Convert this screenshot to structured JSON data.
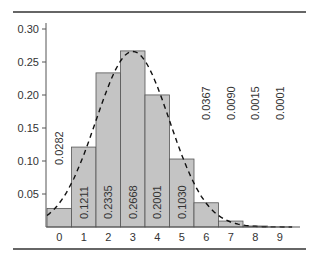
{
  "chart_data": {
    "type": "bar",
    "title": "",
    "xlabel": "",
    "ylabel": "",
    "categories": [
      "0",
      "1",
      "2",
      "3",
      "4",
      "5",
      "6",
      "7",
      "8",
      "9"
    ],
    "values": [
      0.0282,
      0.1211,
      0.2335,
      0.2668,
      0.2001,
      0.103,
      0.0367,
      0.009,
      0.0015,
      0.0001
    ],
    "value_labels": [
      "0.0282",
      "0.1211",
      "0.2335",
      "0.2668",
      "0.2001",
      "0.1030",
      "0.0367",
      "0.0090",
      "0.0015",
      "0.0001"
    ],
    "yticks": [
      "0.05",
      "0.10",
      "0.15",
      "0.20",
      "0.25",
      "0.30"
    ],
    "ylim": [
      0,
      0.3
    ],
    "grid": false,
    "overlay": {
      "type": "line",
      "style": "dashed",
      "description": "fitted density curve"
    },
    "colors": {
      "bar_fill": "#c4c4c4",
      "bar_edge": "#555555",
      "curve": "#111111",
      "rule": "#333333"
    }
  }
}
